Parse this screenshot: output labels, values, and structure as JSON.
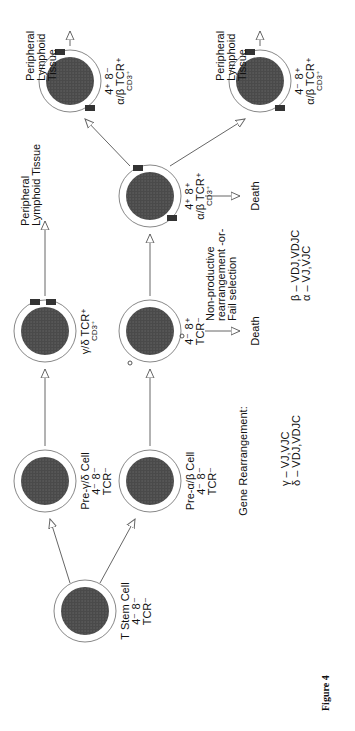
{
  "diagram": {
    "figure_label": "Figure 4",
    "nodes": [
      {
        "id": "stem",
        "lines": [
          "T Stem Cell",
          "4⁻ 8⁻",
          "TCR⁻"
        ]
      },
      {
        "id": "pre_gd",
        "lines": [
          "Pre-γ/δ Cell",
          "4⁻ 8⁻",
          "TCR⁻"
        ]
      },
      {
        "id": "pre_ab",
        "lines": [
          "Pre-α/β Cell",
          "4⁻ 8⁻",
          "TCR⁻"
        ]
      },
      {
        "id": "gd_tcr",
        "lines": [
          "γ/δ TCR⁺",
          "CD3⁺"
        ]
      },
      {
        "id": "dp_tcr",
        "lines": [
          "4⁻ 8⁺",
          "TCR⁻"
        ]
      },
      {
        "id": "dp_ab",
        "lines": [
          "4⁺ 8⁺",
          "α/β TCR⁺",
          "CD3⁺"
        ]
      },
      {
        "id": "cd4",
        "lines": [
          "4⁺ 8⁻",
          "α/β TCR⁺",
          "CD3⁺"
        ]
      },
      {
        "id": "cd8",
        "lines": [
          "4⁻ 8⁺",
          "α/β TCR⁺",
          "CD3⁺"
        ]
      }
    ],
    "destinations": {
      "peripheral_gd": [
        "Peripheral",
        "Lymphoid Tissue"
      ],
      "peripheral_cd4": [
        "Peripheral",
        "Lymphoid Tissue"
      ],
      "peripheral_cd8": [
        "Peripheral",
        "Lymphoid Tissue"
      ],
      "death_1": "Death",
      "death_2": "Death"
    },
    "nonproductive": [
      "Non-productive",
      "rearrangement -or-",
      "Fail selection"
    ],
    "gene_rearrangement": {
      "heading": "Gene Rearrangement:",
      "gd": [
        "γ – VJ,VJC",
        "δ – VDJ,VDJC"
      ],
      "ab": [
        "β – VDJ,VDJC",
        "α – VJ,VJC"
      ]
    }
  }
}
